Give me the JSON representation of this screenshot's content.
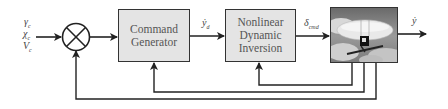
{
  "diagram": {
    "inputs": [
      {
        "symbol": "γ",
        "sub": "c"
      },
      {
        "symbol": "χ",
        "sub": "c"
      },
      {
        "symbol": "V",
        "sub": "c"
      }
    ],
    "summing_junction": {
      "type": "multiply-cross"
    },
    "blocks": [
      {
        "id": "command-generator",
        "lines": [
          "Command",
          "Generator"
        ]
      },
      {
        "id": "ndi",
        "lines": [
          "Nonlinear",
          "Dynamic",
          "Inversion"
        ]
      },
      {
        "id": "plant",
        "image": "airship-aircraft-image"
      }
    ],
    "signals": {
      "yd_dot": {
        "symbol": "ẏ",
        "sub": "d"
      },
      "delta_cmd": {
        "symbol": "δ",
        "sub": "cmd"
      },
      "y_dot": {
        "symbol": "ẏ"
      }
    },
    "colors": {
      "block_fill": "#e4e4e4",
      "line": "#222222",
      "text": "#555555"
    }
  }
}
